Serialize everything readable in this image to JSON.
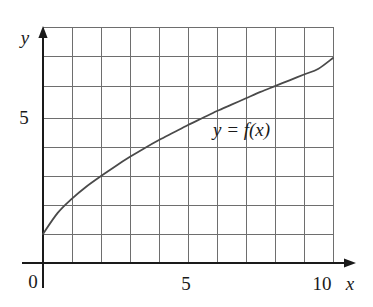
{
  "figure": {
    "title": "",
    "axis_labels": {
      "x": "x",
      "y": "y"
    },
    "tick_labels": {
      "x": [
        "0",
        "5",
        "10"
      ],
      "y": [
        "5"
      ]
    },
    "curve_label": "y = f(x)",
    "curve_label_parts": {
      "y": "y",
      "equals": "=",
      "f": "f",
      "open_paren": "(",
      "x": "x",
      "close_paren": ")"
    },
    "colors": {
      "axis": "#1a1a1a",
      "grid": "#6e6e6e",
      "curve": "#4a4a4a",
      "text": "#1a1a1a",
      "background": "#ffffff"
    }
  },
  "chart_data": {
    "type": "line",
    "title": "",
    "xlabel": "x",
    "ylabel": "y",
    "xlim": [
      0,
      10
    ],
    "ylim": [
      0,
      8
    ],
    "grid": true,
    "grid_spacing": {
      "x": 1,
      "y": 1
    },
    "legend": "none",
    "annotations": [
      {
        "text": "y = f(x)",
        "x": 7.1,
        "y": 4.65
      }
    ],
    "xticks": [
      0,
      5,
      10
    ],
    "yticks": [
      5
    ],
    "series": [
      {
        "name": "y = f(x)",
        "x": [
          0,
          0.5,
          1,
          1.5,
          2,
          2.5,
          3,
          3.5,
          4,
          4.5,
          5,
          5.5,
          6,
          6.5,
          7,
          7.5,
          8,
          8.5,
          9,
          9.5,
          10
        ],
        "values": [
          1.0,
          1.72,
          2.22,
          2.64,
          3.0,
          3.34,
          3.66,
          3.96,
          4.24,
          4.5,
          4.76,
          5.0,
          5.24,
          5.46,
          5.68,
          5.9,
          6.1,
          6.3,
          6.5,
          6.7,
          7.07
        ]
      }
    ]
  }
}
